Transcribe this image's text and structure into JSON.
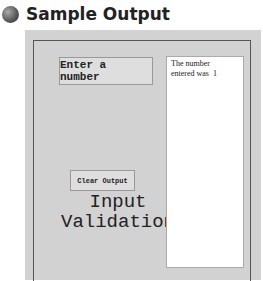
{
  "header": {
    "title": "Sample Output",
    "bullet_icon": "gray-sphere-icon"
  },
  "app": {
    "enter_button_label": "Enter a number",
    "clear_button_label": "Clear Output",
    "caption_line1": "Input",
    "caption_line2": "Validation",
    "output_text": "The number\nentered was  1"
  }
}
